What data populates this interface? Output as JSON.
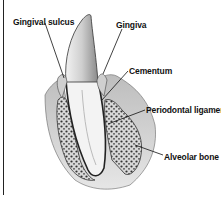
{
  "diagram": {
    "labels": {
      "gingival_sulcus": "Gingival sulcus",
      "gingiva": "Gingiva",
      "cementum": "Cementum",
      "periodontal_ligament": "Periodontal ligamen",
      "alveolar_bone": "Alveolar bone"
    },
    "colors": {
      "background": "#ffffff",
      "ink": "#111111",
      "tissue_gray": "#9a9a9a",
      "bone_dots": "#333333"
    }
  }
}
